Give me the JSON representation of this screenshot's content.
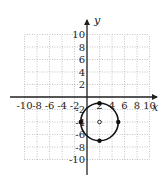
{
  "chart_data": {
    "type": "line",
    "title": "",
    "xlabel": "x",
    "ylabel": "y",
    "xlim": [
      -10,
      10
    ],
    "ylim": [
      -10,
      10
    ],
    "grid": true,
    "grid_step": 2,
    "x_ticks": [
      -10,
      -8,
      -6,
      -4,
      -2,
      2,
      4,
      6,
      8,
      10
    ],
    "x_tick_labels": [
      "-10",
      "-8",
      "-6",
      "-4",
      "-2",
      "2",
      "4",
      "6",
      "8",
      "10"
    ],
    "y_ticks": [
      -10,
      -8,
      -6,
      -4,
      -2,
      2,
      4,
      6,
      8,
      10
    ],
    "y_tick_labels": [
      "-10",
      "-8",
      "-6",
      "-4",
      "-2",
      "2",
      "4",
      "6",
      "8",
      "10"
    ],
    "series": [
      {
        "name": "circle",
        "shape": "circle",
        "center": [
          2,
          -4
        ],
        "radius": 3,
        "marked_points": [
          [
            2,
            -1
          ],
          [
            2,
            -7
          ],
          [
            -1,
            -4
          ],
          [
            5,
            -4
          ]
        ],
        "center_marker": "open"
      }
    ],
    "colors": {
      "curve": "#111111",
      "axis": "#222222",
      "grid": "#9a9a9a"
    }
  }
}
